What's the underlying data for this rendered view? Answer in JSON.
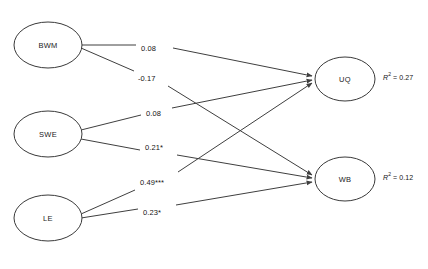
{
  "diagram": {
    "type": "path-diagram",
    "nodes": [
      {
        "id": "BWM",
        "label": "BWM",
        "cx": 48,
        "cy": 45,
        "rx": 34,
        "ry": 23,
        "side": "left"
      },
      {
        "id": "SWE",
        "label": "SWE",
        "cx": 48,
        "cy": 134,
        "rx": 34,
        "ry": 23,
        "side": "left"
      },
      {
        "id": "LE",
        "label": "LE",
        "cx": 48,
        "cy": 218,
        "rx": 34,
        "ry": 23,
        "side": "left"
      },
      {
        "id": "UQ",
        "label": "UQ",
        "cx": 345,
        "cy": 79,
        "rx": 30,
        "ry": 22,
        "side": "right"
      },
      {
        "id": "WB",
        "label": "WB",
        "cx": 345,
        "cy": 179,
        "rx": 30,
        "ry": 22,
        "side": "right"
      }
    ],
    "edges": [
      {
        "from": "BWM",
        "to": "UQ",
        "coefficient": "0.08",
        "significance": "",
        "label_x": 141,
        "label_y": 48
      },
      {
        "from": "BWM",
        "to": "WB",
        "coefficient": "-0.17",
        "significance": "",
        "label_x": 138,
        "label_y": 78
      },
      {
        "from": "SWE",
        "to": "UQ",
        "coefficient": "0.08",
        "significance": "",
        "label_x": 146,
        "label_y": 113
      },
      {
        "from": "SWE",
        "to": "WB",
        "coefficient": "0.21*",
        "significance": "*",
        "label_x": 145,
        "label_y": 147
      },
      {
        "from": "LE",
        "to": "UQ",
        "coefficient": "0.49***",
        "significance": "***",
        "label_x": 140,
        "label_y": 182
      },
      {
        "from": "LE",
        "to": "WB",
        "coefficient": "0.23*",
        "significance": "*",
        "label_x": 143,
        "label_y": 212
      }
    ],
    "r_squared": [
      {
        "node": "UQ",
        "prefix": "R",
        "exponent": "2",
        "equals": " = ",
        "value": "0.27",
        "x": 383,
        "y": 77
      },
      {
        "node": "WB",
        "prefix": "R",
        "exponent": "2",
        "equals": " = ",
        "value": "0.12",
        "x": 383,
        "y": 177
      }
    ],
    "colors": {
      "background": "#ffffff",
      "stroke": "#3f3f3f",
      "node_stroke": "#3a3a3a",
      "text": "#141414"
    }
  }
}
